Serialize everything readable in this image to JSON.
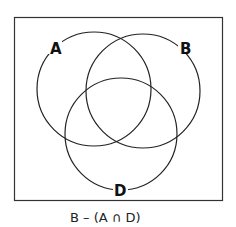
{
  "diagram": {
    "type": "venn",
    "sets": [
      {
        "label": "A",
        "cx": 94,
        "cy": 89,
        "r": 57
      },
      {
        "label": "B",
        "cx": 143,
        "cy": 91,
        "r": 57
      },
      {
        "label": "D",
        "cx": 121,
        "cy": 134,
        "r": 56
      }
    ],
    "caption": "B – (A ∩ D)",
    "stroke_color": "#222222",
    "background": "#ffffff"
  }
}
